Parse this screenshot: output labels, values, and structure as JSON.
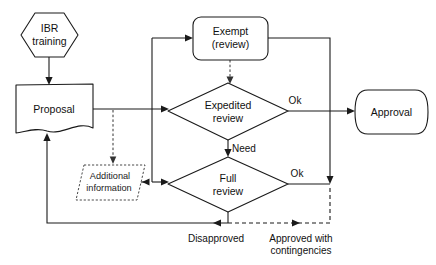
{
  "diagram": {
    "type": "flowchart",
    "background_color": "#ffffff",
    "line_color": "#1a1a1a"
  },
  "nodes": {
    "ibr_training": {
      "label_line1": "IBR",
      "label_line2": "training",
      "shape": "hexagon"
    },
    "proposal": {
      "label": "Proposal",
      "shape": "document"
    },
    "additional_information": {
      "label_line1": "Additional",
      "label_line2": "information",
      "shape": "parallelogram-dashed"
    },
    "exempt": {
      "label_line1": "Exempt",
      "label_line2": "(review)",
      "shape": "rounded-rectangle"
    },
    "expedited_review": {
      "label_line1": "Expedited",
      "label_line2": "review",
      "shape": "diamond"
    },
    "full_review": {
      "label_line1": "Full",
      "label_line2": "review",
      "shape": "diamond"
    },
    "approval": {
      "label": "Approval",
      "shape": "rounded-cylinder"
    }
  },
  "edge_labels": {
    "expedited_ok": "Ok",
    "full_ok": "Ok",
    "need": "Need",
    "disapproved": "Disapproved",
    "approved_with_contingencies_line1": "Approved with",
    "approved_with_contingencies_line2": "contingencies"
  }
}
